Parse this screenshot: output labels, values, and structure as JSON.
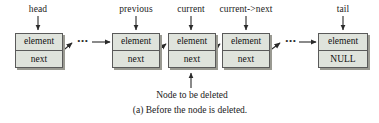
{
  "figure": {
    "type": "linked-list-diagram",
    "caption": "(a) Before the node is deleted.",
    "annotation": "Node to be deleted",
    "colors": {
      "node_fill": "#dfe3dc",
      "node_border": "#5a5a5a",
      "node_shadow": "#9a9a92",
      "text": "#1a1a1a",
      "arrow": "#2a2a2a"
    }
  },
  "pointer_labels": [
    {
      "text": "head",
      "x": 38
    },
    {
      "text": "previous",
      "x": 136
    },
    {
      "text": "current",
      "x": 191
    },
    {
      "text": "current->next",
      "x": 246
    },
    {
      "text": "tail",
      "x": 343
    }
  ],
  "nodes": [
    {
      "id": "head-node",
      "element": "element",
      "next": "next",
      "x": 15
    },
    {
      "id": "previous-node",
      "element": "element",
      "next": "next",
      "x": 112
    },
    {
      "id": "current-node",
      "element": "element",
      "next": "next",
      "x": 168
    },
    {
      "id": "current-next-node",
      "element": "element",
      "next": "next",
      "x": 222
    },
    {
      "id": "tail-node",
      "element": "element",
      "next": "NULL",
      "x": 318
    }
  ],
  "ellipses": [
    {
      "text": "•••",
      "x": 83
    },
    {
      "text": "•••",
      "x": 291
    }
  ]
}
